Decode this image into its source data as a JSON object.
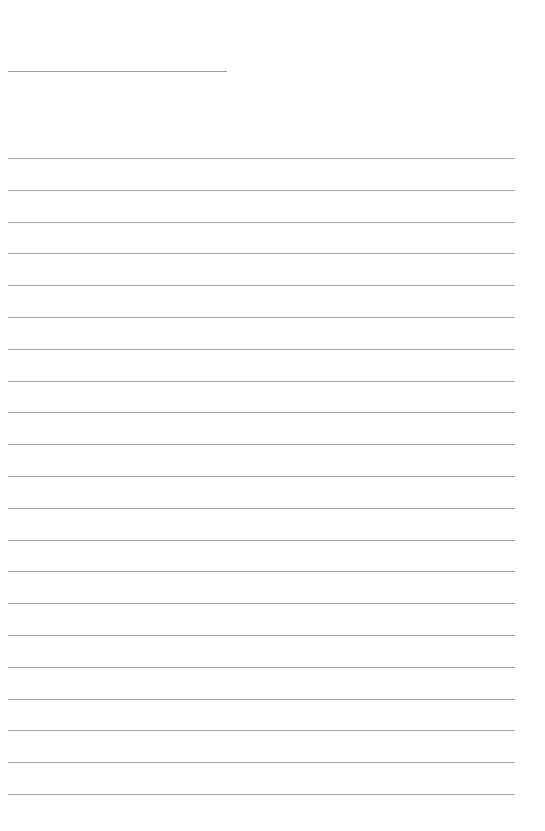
{
  "document": {
    "type": "blank lined paper",
    "title_line": {
      "text": ""
    },
    "ruled_lines": {
      "count": 21,
      "lines": [
        "",
        "",
        "",
        "",
        "",
        "",
        "",
        "",
        "",
        "",
        "",
        "",
        "",
        "",
        "",
        "",
        "",
        "",
        "",
        "",
        ""
      ]
    },
    "colors": {
      "background": "#ffffff",
      "line": "#a8a8a8"
    }
  }
}
